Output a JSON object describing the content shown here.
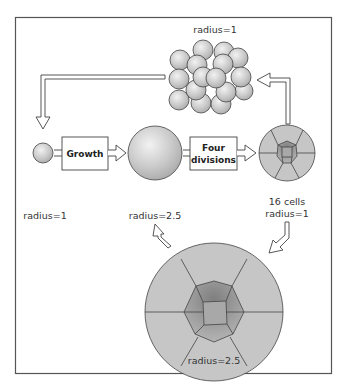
{
  "diagram": {
    "title": "",
    "frame": {
      "border_color": "#555555",
      "background": "#ffffff"
    },
    "colors": {
      "sphere_fill": "#c8c8c8",
      "sphere_highlight": "#eeeeee",
      "outline": "#444444",
      "outer_cell_fill": "#c6c6c6",
      "inner_ring_fill": "#9a9a9a",
      "center_cell_fill": "#a8a8a8",
      "arrow_fill": "#ffffff"
    },
    "nodes": {
      "cluster": {
        "label": "radius=1",
        "description": "cluster of 16 spheres"
      },
      "small_sphere": {
        "label": "radius=1"
      },
      "large_sphere": {
        "label": "radius=2.5"
      },
      "blastula_small": {
        "label_line1": "16 cells",
        "label_line2": "radius=1"
      },
      "blastula_large": {
        "label": "radius=2.5"
      }
    },
    "process_boxes": {
      "growth": {
        "label": "Growth"
      },
      "divisions": {
        "label_line1": "Four",
        "label_line2": "divisions"
      }
    },
    "arrows": [
      {
        "from": "cluster",
        "to": "small_sphere"
      },
      {
        "from": "small_sphere",
        "to": "growth"
      },
      {
        "from": "growth",
        "to": "large_sphere"
      },
      {
        "from": "large_sphere",
        "to": "divisions"
      },
      {
        "from": "divisions",
        "to": "blastula_small"
      },
      {
        "from": "blastula_small",
        "to": "cluster"
      },
      {
        "from": "blastula_small",
        "to": "blastula_large"
      },
      {
        "from": "blastula_large",
        "to": "large_sphere"
      }
    ]
  }
}
